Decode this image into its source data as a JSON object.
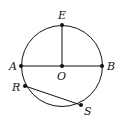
{
  "diagram": {
    "type": "circle-geometry",
    "circle": {
      "center": "O",
      "cx": 62,
      "cy": 66,
      "r": 40
    },
    "points": [
      {
        "name": "E",
        "x": 62,
        "y": 25
      },
      {
        "name": "A",
        "x": 21,
        "y": 66
      },
      {
        "name": "O",
        "x": 62,
        "y": 66
      },
      {
        "name": "B",
        "x": 102,
        "y": 66
      },
      {
        "name": "R",
        "x": 25,
        "y": 86
      },
      {
        "name": "S",
        "x": 81,
        "y": 105
      }
    ],
    "segments": [
      {
        "from": "A",
        "to": "B"
      },
      {
        "from": "O",
        "to": "E"
      },
      {
        "from": "R",
        "to": "S"
      }
    ],
    "labels": {
      "E": "E",
      "A": "A",
      "O": "O",
      "B": "B",
      "R": "R",
      "S": "S"
    },
    "colors": {
      "stroke": "#111111",
      "background": "#ffffff"
    }
  }
}
